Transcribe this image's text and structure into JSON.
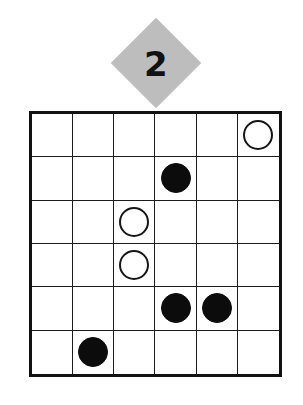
{
  "page": {
    "background_color": "#ffffff",
    "width": 303,
    "height": 405
  },
  "badge": {
    "shape": "diamond",
    "label": "2",
    "fill_color": "#bdbdbd",
    "text_color": "#111111"
  },
  "board": {
    "rows": 6,
    "columns": 6,
    "border_color": "#121212",
    "grid_line_color": "#1c1c1c",
    "cell_background": "#ffffff",
    "black_stone_color": "#0c0c0c",
    "white_stone_fill": "#ffffff",
    "white_stone_outline": "#161616",
    "cells": [
      [
        {
          "stone": "empty",
          "label": ""
        },
        {
          "stone": "empty",
          "label": ""
        },
        {
          "stone": "empty",
          "label": ""
        },
        {
          "stone": "empty",
          "label": ""
        },
        {
          "stone": "empty",
          "label": ""
        },
        {
          "stone": "white",
          "label": ""
        }
      ],
      [
        {
          "stone": "empty",
          "label": ""
        },
        {
          "stone": "empty",
          "label": ""
        },
        {
          "stone": "empty",
          "label": ""
        },
        {
          "stone": "black",
          "label": ""
        },
        {
          "stone": "empty",
          "label": ""
        },
        {
          "stone": "empty",
          "label": ""
        }
      ],
      [
        {
          "stone": "empty",
          "label": ""
        },
        {
          "stone": "empty",
          "label": ""
        },
        {
          "stone": "white",
          "label": ""
        },
        {
          "stone": "empty",
          "label": ""
        },
        {
          "stone": "empty",
          "label": ""
        },
        {
          "stone": "empty",
          "label": ""
        }
      ],
      [
        {
          "stone": "empty",
          "label": ""
        },
        {
          "stone": "empty",
          "label": ""
        },
        {
          "stone": "white",
          "label": ""
        },
        {
          "stone": "empty",
          "label": ""
        },
        {
          "stone": "empty",
          "label": ""
        },
        {
          "stone": "empty",
          "label": ""
        }
      ],
      [
        {
          "stone": "empty",
          "label": ""
        },
        {
          "stone": "empty",
          "label": ""
        },
        {
          "stone": "empty",
          "label": ""
        },
        {
          "stone": "black",
          "label": ""
        },
        {
          "stone": "black",
          "label": ""
        },
        {
          "stone": "empty",
          "label": ""
        }
      ],
      [
        {
          "stone": "empty",
          "label": ""
        },
        {
          "stone": "black",
          "label": ""
        },
        {
          "stone": "empty",
          "label": ""
        },
        {
          "stone": "empty",
          "label": ""
        },
        {
          "stone": "empty",
          "label": ""
        },
        {
          "stone": "empty",
          "label": ""
        }
      ]
    ]
  }
}
